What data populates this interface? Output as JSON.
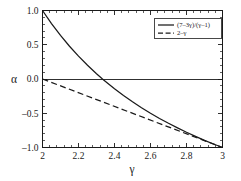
{
  "chart_data": {
    "type": "line",
    "title": "",
    "xlabel": "γ",
    "ylabel": "α",
    "xlim": [
      2,
      3
    ],
    "ylim": [
      -1.0,
      1.0
    ],
    "grid": false,
    "legend_position": "top-right",
    "x_ticks": [
      {
        "value": 2,
        "label": "2"
      },
      {
        "value": 2.2,
        "label": "2.2"
      },
      {
        "value": 2.4,
        "label": "2.4"
      },
      {
        "value": 2.6,
        "label": "2.6"
      },
      {
        "value": 2.8,
        "label": "2.8"
      },
      {
        "value": 3,
        "label": "3"
      }
    ],
    "y_ticks": [
      {
        "value": 1.0,
        "label": "1.0"
      },
      {
        "value": 0.5,
        "label": "0.5"
      },
      {
        "value": 0.0,
        "label": "0.0"
      },
      {
        "value": -0.5,
        "label": "–0.5"
      },
      {
        "value": -1.0,
        "label": "–1.0"
      }
    ],
    "minor_ticks_per_interval": 5,
    "annotations": [
      {
        "type": "zero-line",
        "y": 0.0
      }
    ],
    "series": [
      {
        "name": "(7–3γ)/(γ–1)",
        "style": "solid",
        "color": "#1a1a1a",
        "x": [
          2.0,
          2.05,
          2.1,
          2.15,
          2.2,
          2.25,
          2.3,
          2.3333,
          2.35,
          2.4,
          2.45,
          2.5,
          2.55,
          2.6,
          2.65,
          2.7,
          2.75,
          2.8,
          2.85,
          2.9,
          2.95,
          3.0
        ],
        "y": [
          1.0,
          0.81,
          0.636,
          0.478,
          0.333,
          0.2,
          0.077,
          0.0,
          -0.037,
          -0.143,
          -0.241,
          -0.333,
          -0.419,
          -0.5,
          -0.576,
          -0.647,
          -0.714,
          -0.778,
          -0.838,
          -0.895,
          -0.949,
          -1.0
        ]
      },
      {
        "name": "2–γ",
        "style": "dashed",
        "color": "#1a1a1a",
        "x": [
          2.0,
          3.0
        ],
        "y": [
          0.0,
          -1.0
        ]
      }
    ]
  },
  "legend": {
    "entries": [
      {
        "label": "(7–3γ)/(γ–1)",
        "style": "solid"
      },
      {
        "label": "2–γ",
        "style": "dashed"
      }
    ]
  }
}
